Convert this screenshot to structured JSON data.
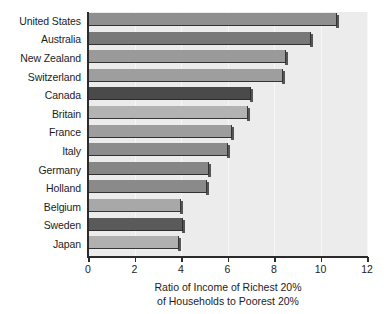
{
  "chart_data": {
    "type": "bar",
    "orientation": "horizontal",
    "title": "",
    "xlabel_line1": "Ratio of Income of Richest 20%",
    "xlabel_line2": "of Households to Poorest 20%",
    "ylabel": "",
    "xlim": [
      0,
      12
    ],
    "xticks": [
      0,
      2,
      4,
      6,
      8,
      10,
      12
    ],
    "xtick_labels": [
      "0",
      "2",
      "4",
      "6",
      "8",
      "10",
      "12"
    ],
    "grid": true,
    "legend": "none",
    "categories": [
      "United States",
      "Australia",
      "New Zealand",
      "Switzerland",
      "Canada",
      "Britain",
      "France",
      "Italy",
      "Germany",
      "Holland",
      "Belgium",
      "Sweden",
      "Japan"
    ],
    "values": [
      10.7,
      9.6,
      8.5,
      8.4,
      7.0,
      6.9,
      6.2,
      6.0,
      5.2,
      5.1,
      4.0,
      4.1,
      3.9
    ],
    "bar_colors": [
      "#8f8f8f",
      "#787878",
      "#9a9a9a",
      "#9e9e9e",
      "#4a4a4a",
      "#b3b3b3",
      "#9d9d9d",
      "#8c8c8c",
      "#868686",
      "#8a8a8a",
      "#a8a8a8",
      "#5a5a5a",
      "#b0b0b0"
    ],
    "plot_background": "#ececed",
    "axis_color": "#2b2b2b"
  }
}
